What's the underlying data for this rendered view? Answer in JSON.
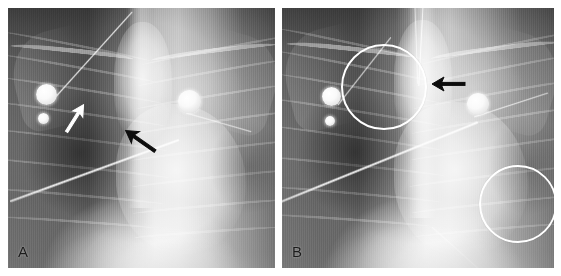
{
  "figure": {
    "type": "radiograph-figure",
    "modality": "chest-radiograph",
    "panel_count": 2,
    "background_color": "#ffffff"
  },
  "panels": [
    {
      "id": "A",
      "label": "A",
      "label_color": "#1b1b1b",
      "annotations": [
        {
          "kind": "arrow",
          "name": "white-arrow",
          "color": "#ffffff",
          "direction": "up-right",
          "angle_deg": -58,
          "x": 62,
          "y": 108,
          "length": 34,
          "description": "white arrow indicating right upper lung field finding"
        },
        {
          "kind": "arrow",
          "name": "black-arrow",
          "color": "#111111",
          "direction": "up-left",
          "angle_deg": 215,
          "x": 135,
          "y": 133,
          "length": 36,
          "description": "black arrow indicating catheter tip position"
        }
      ],
      "devices": [
        {
          "kind": "electrode",
          "name": "ecg-electrode",
          "x": 38,
          "y": 86,
          "d": 21
        },
        {
          "kind": "electrode",
          "name": "ecg-electrode",
          "x": 35,
          "y": 110,
          "d": 11
        },
        {
          "kind": "electrode",
          "name": "ecg-electrode",
          "x": 181,
          "y": 93,
          "d": 23
        },
        {
          "kind": "catheter",
          "name": "indwelling-catheter-line",
          "description": "diagonal radiopaque line from lower-left to mid-right"
        },
        {
          "kind": "lead",
          "name": "ecg-lead-wire",
          "description": "lead wire from electrode toward upper-right"
        }
      ]
    },
    {
      "id": "B",
      "label": "B",
      "label_color": "#1b1b1b",
      "annotations": [
        {
          "kind": "circle",
          "name": "circled-region-upper-right-lung",
          "color": "#ffffff",
          "cx": 100,
          "cy": 77,
          "r": 41,
          "description": "white circle highlighting right upper lung zone"
        },
        {
          "kind": "circle",
          "name": "circled-region-lower-left-lung",
          "color": "#ffffff",
          "cx": 234,
          "cy": 194,
          "r": 37,
          "description": "white circle highlighting left lower lung zone"
        },
        {
          "kind": "arrow",
          "name": "black-arrow",
          "color": "#111111",
          "direction": "left",
          "angle_deg": 180,
          "x": 167,
          "y": 76,
          "length": 30,
          "description": "black arrow pointing to midline tube tip"
        }
      ],
      "devices": [
        {
          "kind": "electrode",
          "name": "ecg-electrode",
          "x": 49,
          "y": 88,
          "d": 19
        },
        {
          "kind": "electrode",
          "name": "ecg-electrode",
          "x": 48,
          "y": 113,
          "d": 10
        },
        {
          "kind": "electrode",
          "name": "ecg-electrode",
          "x": 196,
          "y": 96,
          "d": 22
        },
        {
          "kind": "catheter",
          "name": "indwelling-catheter-line",
          "description": "diagonal radiopaque line crossing lung fields"
        },
        {
          "kind": "endotracheal-tube",
          "name": "endotracheal-tube",
          "description": "vertical midline tube descending from top of image"
        }
      ]
    }
  ]
}
